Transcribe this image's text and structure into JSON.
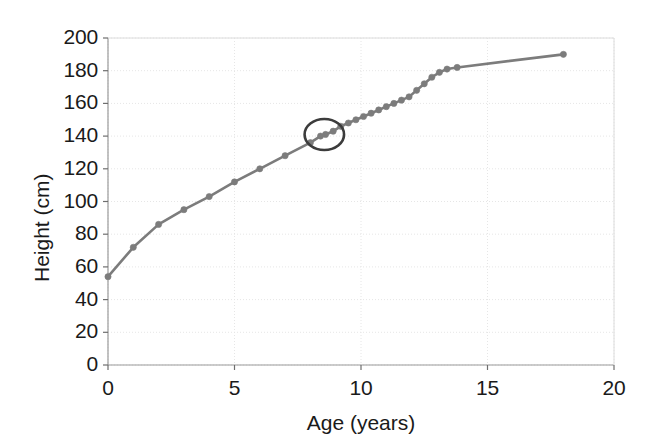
{
  "chart_data": {
    "type": "line",
    "title": "",
    "xlabel": "Age (years)",
    "ylabel": "Height (cm)",
    "xlim": [
      0,
      20
    ],
    "ylim": [
      0,
      200
    ],
    "xticks": [
      0,
      5,
      10,
      15,
      20
    ],
    "yticks": [
      0,
      20,
      40,
      60,
      80,
      100,
      120,
      140,
      160,
      180,
      200
    ],
    "xtick_labels": [
      "0",
      "5",
      "10",
      "15",
      "20"
    ],
    "ytick_labels": [
      "0",
      "20",
      "40",
      "60",
      "80",
      "100",
      "120",
      "140",
      "160",
      "180",
      "200"
    ],
    "grid": true,
    "legend": "none",
    "series": [
      {
        "name": "Height",
        "marker": "circle",
        "color": "#7c7c7c",
        "x": [
          0,
          1,
          2,
          3,
          4,
          5,
          6,
          7,
          8,
          8.4,
          8.6,
          8.9,
          9.2,
          9.5,
          9.8,
          10.1,
          10.4,
          10.7,
          11.0,
          11.3,
          11.6,
          11.9,
          12.2,
          12.5,
          12.8,
          13.1,
          13.4,
          13.8,
          18.0
        ],
        "y": [
          54,
          72,
          86,
          95,
          103,
          112,
          120,
          128,
          136,
          140,
          141,
          143,
          146,
          148,
          150,
          152,
          154,
          156,
          158,
          160,
          162,
          164,
          168,
          172,
          176,
          179,
          181,
          182,
          190
        ]
      }
    ],
    "annotations": [
      {
        "type": "ellipse",
        "name": "highlight-ellipse",
        "center_x": 8.55,
        "center_y": 141,
        "radius_x": 0.78,
        "radius_y": 9.5,
        "color": "#3c3c3c"
      }
    ]
  },
  "axes": {
    "x_title": "Age (years)",
    "y_title": "Height (cm)"
  }
}
